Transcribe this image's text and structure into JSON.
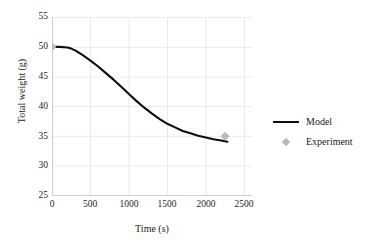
{
  "chart_data": {
    "type": "line",
    "title": "",
    "xlabel": "Time (s)",
    "ylabel": "Total weight (g)",
    "xlim": [
      0,
      2600
    ],
    "ylim": [
      25,
      55
    ],
    "xticks": [
      0,
      500,
      1000,
      1500,
      2000,
      2500
    ],
    "yticks": [
      25,
      30,
      35,
      40,
      45,
      50,
      55
    ],
    "grid": true,
    "legend_position": "right",
    "colors": {
      "model_line": "#0d0d0d",
      "experiment_marker": "#b9b9b9",
      "grid": "#e8e8e8",
      "axis": "#d0d0d0",
      "text": "#1a1a1a"
    },
    "series": [
      {
        "name": "Model",
        "type": "line",
        "color": "#0d0d0d",
        "x": [
          0,
          100,
          200,
          250,
          300,
          400,
          500,
          600,
          700,
          800,
          900,
          1000,
          1100,
          1200,
          1300,
          1400,
          1500,
          1600,
          1700,
          1800,
          1900,
          2000,
          2100,
          2200,
          2280
        ],
        "y": [
          50.0,
          50.0,
          49.9,
          49.7,
          49.4,
          48.6,
          47.7,
          46.7,
          45.6,
          44.5,
          43.3,
          42.1,
          40.9,
          39.8,
          38.8,
          37.9,
          37.1,
          36.5,
          35.9,
          35.5,
          35.1,
          34.8,
          34.5,
          34.3,
          34.1
        ]
      },
      {
        "name": "Experiment",
        "type": "scatter",
        "marker": "diamond",
        "color": "#b9b9b9",
        "x": [
          0,
          2250
        ],
        "y": [
          50.0,
          35.0
        ]
      }
    ]
  },
  "axis": {
    "ytick_labels": [
      "55",
      "50",
      "45",
      "40",
      "35",
      "30",
      "25"
    ],
    "xtick_labels": [
      "0",
      "500",
      "1000",
      "1500",
      "2000",
      "2500"
    ],
    "ylabel_text": "Total weight (g)",
    "xlabel_text": "Time (s)"
  },
  "legend": {
    "items": [
      {
        "label": "Model",
        "key": "line-swatch"
      },
      {
        "label": "Experiment",
        "key": "diamond-swatch"
      }
    ]
  }
}
